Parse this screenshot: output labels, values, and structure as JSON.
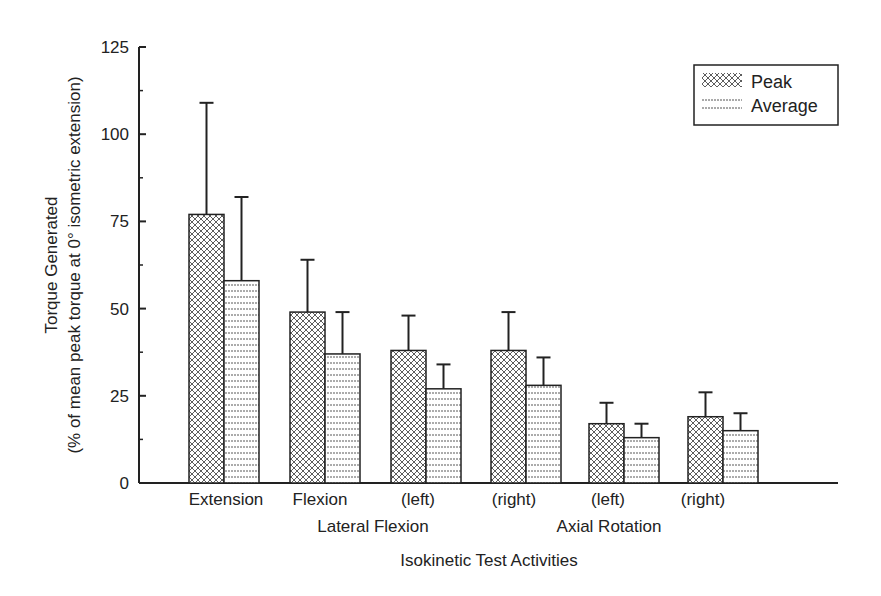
{
  "chart_data": {
    "type": "bar",
    "title": "",
    "xlabel": "Isokinetic Test Activities",
    "ylabel_line1": "Torque Generated",
    "ylabel_line2": "(% of mean peak torque at 0° isometric extension)",
    "ylim": [
      0,
      125
    ],
    "yticks": [
      0,
      25,
      50,
      75,
      100,
      125
    ],
    "grid": false,
    "legend_position": "top-right",
    "categories": [
      "Extension",
      "Flexion",
      "(left)",
      "(right)",
      "(left)",
      "(right)"
    ],
    "category_groups": [
      {
        "label": "Lateral Flexion",
        "members": [
          "(left)",
          "(right)"
        ]
      },
      {
        "label": "Axial Rotation",
        "members": [
          "(left)",
          "(right)"
        ]
      }
    ],
    "series": [
      {
        "name": "Peak",
        "pattern": "crosshatch",
        "values": [
          77,
          49,
          38,
          38,
          17,
          19
        ],
        "error": [
          32,
          15,
          10,
          11,
          6,
          7
        ]
      },
      {
        "name": "Average",
        "pattern": "horizontal-lines",
        "values": [
          58,
          37,
          27,
          28,
          13,
          15
        ],
        "error": [
          24,
          12,
          7,
          8,
          4,
          5
        ]
      }
    ]
  },
  "labels": {
    "yticks": [
      "0",
      "25",
      "50",
      "75",
      "100",
      "125"
    ],
    "cats": [
      "Extension",
      "Flexion",
      "(left)",
      "(right)",
      "(left)",
      "(right)"
    ],
    "group1": "Lateral Flexion",
    "group2": "Axial Rotation",
    "xlabel": "Isokinetic Test Activities",
    "ylabel1": "Torque Generated",
    "ylabel2": "(% of mean peak torque at 0° isometric extension)",
    "legend_peak": "Peak",
    "legend_avg": "Average"
  }
}
